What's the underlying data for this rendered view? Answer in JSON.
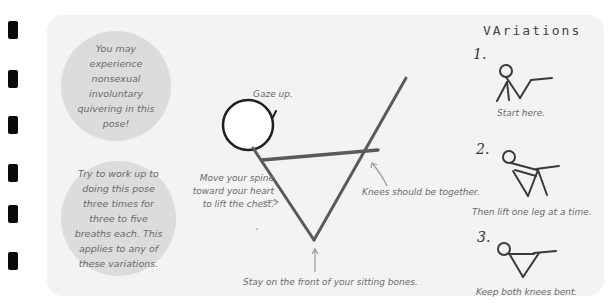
{
  "binder_holes": [
    21,
    70,
    116,
    164,
    205,
    252
  ],
  "tips": {
    "quivering": "You may experience nonsexual involuntary quivering in this pose!",
    "repetitions": "Try to work up to doing this pose three times for three to five breaths each. This applies to any of these variations."
  },
  "main_figure": {
    "annotations": {
      "gaze": "Gaze up.",
      "spine": "Move your spine toward your heart to lift the chest.",
      "knees": "Knees should be together.",
      "sitting_bones": "Stay on the front of your sitting bones."
    }
  },
  "variations": {
    "heading": "VAriations",
    "items": [
      {
        "number": "1.",
        "caption": "Start here."
      },
      {
        "number": "2.",
        "caption": "Then lift one leg at a time."
      },
      {
        "number": "3.",
        "caption": "Keep both knees bent."
      }
    ]
  },
  "colors": {
    "panel": "#f3f3f3",
    "bubble": "#dcdcdc",
    "text": "#6a6a6a",
    "figure_line": "#5a5a5a"
  }
}
